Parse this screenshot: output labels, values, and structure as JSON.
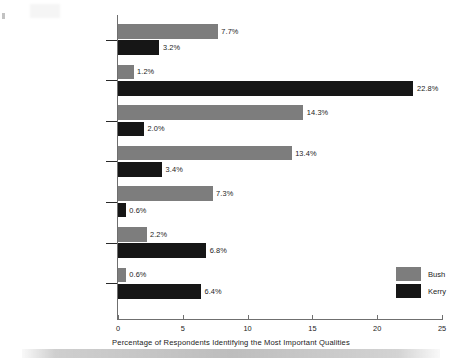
{
  "chart_data": {
    "type": "bar",
    "orientation": "horizontal",
    "title": "",
    "xlabel": "Percentage of Respondents Identifying the Most Important Qualities",
    "ylabel": "",
    "xlim": [
      0,
      25
    ],
    "xticks": [
      "0",
      "5",
      "10",
      "15",
      "20",
      "25"
    ],
    "grid": false,
    "legend_position": "right-bottom",
    "categories": [
      "Is honest, trustworthy",
      "Will bring change",
      "Is a strong leader",
      "Clear stand on issues",
      "Religious faith",
      "Cares about people",
      "Is intelligent"
    ],
    "series": [
      {
        "name": "Bush",
        "color": "#7d7d7d",
        "values": [
          7.7,
          1.2,
          14.3,
          13.4,
          7.3,
          2.2,
          0.6
        ],
        "labels": [
          "7.7%",
          "1.2%",
          "14.3%",
          "13.4%",
          "7.3%",
          "2.2%",
          "0.6%"
        ]
      },
      {
        "name": "Kerry",
        "color": "#161616",
        "values": [
          3.2,
          22.8,
          2.0,
          3.4,
          0.6,
          6.8,
          6.4
        ],
        "labels": [
          "3.2%",
          "22.8%",
          "2.0%",
          "3.4%",
          "0.6%",
          "6.8%",
          "6.4%"
        ]
      }
    ]
  },
  "legend": {
    "items": [
      {
        "label": "Bush",
        "color": "#7d7d7d"
      },
      {
        "label": "Kerry",
        "color": "#161616"
      }
    ]
  }
}
